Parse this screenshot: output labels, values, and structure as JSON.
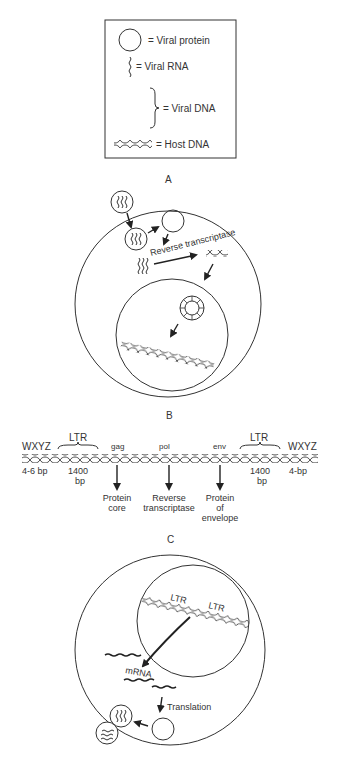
{
  "legend": {
    "items": [
      {
        "symbol": "circle",
        "label": "= Viral protein"
      },
      {
        "symbol": "wavy-line",
        "label": "= Viral RNA"
      },
      {
        "symbol": "brace",
        "label": "= Viral DNA"
      },
      {
        "symbol": "double-helix",
        "label": "= Host DNA"
      }
    ]
  },
  "panels": {
    "a": {
      "label": "A",
      "enzyme_label": "Reverse transcriptase"
    },
    "b": {
      "label": "B",
      "left_repeat": "WXYZ",
      "left_repeat_size": "4-6 bp",
      "right_repeat": "WXYZ",
      "right_repeat_size": "4-bp",
      "ltr_left": "LTR",
      "ltr_left_size_1": "1400",
      "ltr_left_size_2": "bp",
      "ltr_right": "LTR",
      "ltr_right_size_1": "1400",
      "ltr_right_size_2": "bp",
      "genes": [
        {
          "name": "gag",
          "product_1": "Protein",
          "product_2": "core",
          "product_3": ""
        },
        {
          "name": "pol",
          "product_1": "Reverse",
          "product_2": "transcriptase",
          "product_3": ""
        },
        {
          "name": "env",
          "product_1": "Protein",
          "product_2": "of",
          "product_3": "envelope"
        }
      ]
    },
    "c": {
      "label": "C",
      "ltr_1": "LTR",
      "ltr_2": "LTR",
      "mrna": "mRNA",
      "translation": "Translation"
    }
  }
}
